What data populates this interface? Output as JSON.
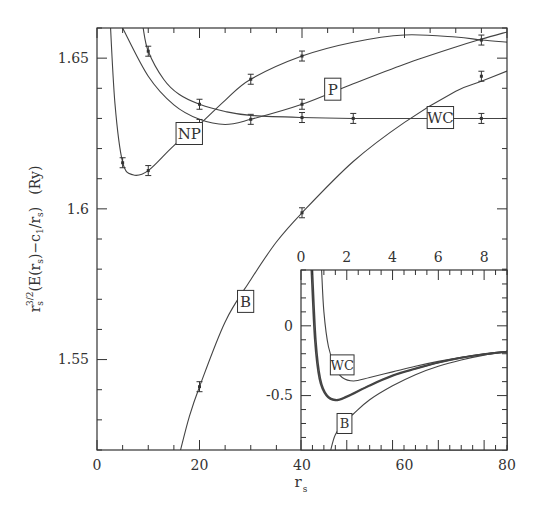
{
  "chart_data": [
    {
      "type": "line",
      "title": "",
      "xlabel": "r_s",
      "ylabel": "r_s^{3/2}(E(r_s) - c_1/r_s)  (Ry)",
      "xlim": [
        0,
        80
      ],
      "ylim": [
        1.52,
        1.66
      ],
      "xticks": [
        0,
        20,
        40,
        60,
        80
      ],
      "yticks": [
        1.55,
        1.6,
        1.65
      ],
      "ytick_labels": [
        "1.55",
        "1.6",
        "1.65"
      ],
      "grid": false,
      "legend": "inline boxed labels",
      "series": [
        {
          "name": "NP",
          "label_pos": [
            18,
            1.625
          ],
          "curve": [
            [
              2.5,
              1.665
            ],
            [
              3.5,
              1.635
            ],
            [
              5,
              1.6155
            ],
            [
              7,
              1.6113
            ],
            [
              10,
              1.6127
            ],
            [
              15,
              1.621
            ],
            [
              20,
              1.628
            ],
            [
              25,
              1.636
            ],
            [
              30,
              1.643
            ],
            [
              40,
              1.6507
            ],
            [
              50,
              1.6553
            ],
            [
              60,
              1.6577
            ],
            [
              70,
              1.657
            ],
            [
              75,
              1.656
            ],
            [
              80,
              1.6553
            ]
          ],
          "points": [
            {
              "x": 5,
              "y": 1.6153
            },
            {
              "x": 10,
              "y": 1.6127
            },
            {
              "x": 30,
              "y": 1.643
            },
            {
              "x": 40,
              "y": 1.6507
            }
          ]
        },
        {
          "name": "P",
          "label_pos": [
            46,
            1.6397
          ],
          "curve": [
            [
              5,
              1.66
            ],
            [
              10,
              1.644
            ],
            [
              15,
              1.6345
            ],
            [
              20,
              1.6297
            ],
            [
              25,
              1.628
            ],
            [
              30,
              1.6297
            ],
            [
              40,
              1.6347
            ],
            [
              50,
              1.6415
            ],
            [
              60,
              1.648
            ],
            [
              70,
              1.6537
            ],
            [
              75,
              1.6563
            ],
            [
              80,
              1.6587
            ]
          ],
          "points": [
            {
              "x": 20,
              "y": 1.628
            },
            {
              "x": 30,
              "y": 1.6297
            },
            {
              "x": 40,
              "y": 1.6347
            },
            {
              "x": 75,
              "y": 1.656
            }
          ]
        },
        {
          "name": "WC",
          "label_pos": [
            67,
            1.6303
          ],
          "curve": [
            [
              9,
              1.66
            ],
            [
              10,
              1.6523
            ],
            [
              13,
              1.643
            ],
            [
              16,
              1.638
            ],
            [
              20,
              1.6347
            ],
            [
              25,
              1.6323
            ],
            [
              30,
              1.631
            ],
            [
              40,
              1.6303
            ],
            [
              50,
              1.63
            ],
            [
              60,
              1.63
            ],
            [
              75,
              1.63
            ],
            [
              80,
              1.63
            ]
          ],
          "points": [
            {
              "x": 10,
              "y": 1.6523
            },
            {
              "x": 20,
              "y": 1.6347
            },
            {
              "x": 40,
              "y": 1.6303
            },
            {
              "x": 50,
              "y": 1.63
            },
            {
              "x": 75,
              "y": 1.63
            }
          ]
        },
        {
          "name": "B",
          "label_pos": [
            29,
            1.5693
          ],
          "curve": [
            [
              16.3,
              1.52
            ],
            [
              18,
              1.531
            ],
            [
              20,
              1.541
            ],
            [
              25,
              1.5625
            ],
            [
              30,
              1.5765
            ],
            [
              35,
              1.589
            ],
            [
              40,
              1.5987
            ],
            [
              50,
              1.6157
            ],
            [
              60,
              1.6287
            ],
            [
              70,
              1.639
            ],
            [
              75,
              1.6423
            ],
            [
              80,
              1.6457
            ]
          ],
          "points": [
            {
              "x": 20,
              "y": 1.541
            },
            {
              "x": 40,
              "y": 1.5987
            },
            {
              "x": 75,
              "y": 1.644
            }
          ]
        }
      ]
    },
    {
      "type": "line",
      "title": "inset",
      "xlabel": "",
      "ylabel": "",
      "xlim": [
        0,
        9
      ],
      "ylim": [
        -0.89,
        0.4
      ],
      "xticks": [
        0,
        2,
        4,
        6,
        8
      ],
      "yticks": [
        0,
        -0.5
      ],
      "ytick_labels": [
        "0",
        "-0.5"
      ],
      "grid": false,
      "series": [
        {
          "name": "NP",
          "label_pos": null,
          "thick": true,
          "curve": [
            [
              0.45,
              0.4
            ],
            [
              0.6,
              -0.1
            ],
            [
              0.8,
              -0.38
            ],
            [
              1.1,
              -0.5
            ],
            [
              1.5,
              -0.535
            ],
            [
              2,
              -0.51
            ],
            [
              3,
              -0.43
            ],
            [
              4,
              -0.36
            ],
            [
              5,
              -0.31
            ],
            [
              6,
              -0.265
            ],
            [
              7,
              -0.23
            ],
            [
              8,
              -0.205
            ],
            [
              9,
              -0.185
            ]
          ]
        },
        {
          "name": "P",
          "label_pos": null,
          "thick": true,
          "curve": [
            [
              0.5,
              0.4
            ],
            [
              0.65,
              -0.1
            ],
            [
              0.85,
              -0.38
            ],
            [
              1.15,
              -0.5
            ],
            [
              1.55,
              -0.53
            ],
            [
              2,
              -0.505
            ],
            [
              3,
              -0.425
            ],
            [
              4,
              -0.355
            ],
            [
              5,
              -0.305
            ],
            [
              6,
              -0.262
            ],
            [
              7,
              -0.228
            ],
            [
              8,
              -0.203
            ],
            [
              9,
              -0.185
            ]
          ]
        },
        {
          "name": "WC",
          "label_pos": [
            1.8,
            -0.28
          ],
          "thick": false,
          "curve": [
            [
              0.9,
              0.4
            ],
            [
              1.0,
              0.1
            ],
            [
              1.2,
              -0.15
            ],
            [
              1.5,
              -0.3
            ],
            [
              1.8,
              -0.37
            ],
            [
              2.3,
              -0.395
            ],
            [
              3,
              -0.37
            ],
            [
              4,
              -0.33
            ],
            [
              5,
              -0.29
            ],
            [
              6,
              -0.255
            ],
            [
              7,
              -0.225
            ],
            [
              8,
              -0.2
            ],
            [
              9,
              -0.183
            ]
          ]
        },
        {
          "name": "B",
          "label_pos": [
            1.9,
            -0.7
          ],
          "thick": false,
          "curve": [
            [
              1.3,
              -0.89
            ],
            [
              1.5,
              -0.78
            ],
            [
              1.9,
              -0.69
            ],
            [
              2.3,
              -0.63
            ],
            [
              3,
              -0.53
            ],
            [
              4,
              -0.43
            ],
            [
              5,
              -0.35
            ],
            [
              6,
              -0.29
            ],
            [
              7,
              -0.245
            ],
            [
              8,
              -0.21
            ],
            [
              9,
              -0.187
            ]
          ]
        }
      ]
    }
  ],
  "axes": {
    "xlabel_main": "r",
    "xlabel_sub": "s",
    "ylabel_parts": [
      "r",
      "s",
      "3/2",
      "(E(r",
      "s",
      ")−c",
      "1",
      "/r",
      "s",
      ")",
      "(Ry)"
    ]
  },
  "labels": {
    "NP": "NP",
    "P": "P",
    "WC": "WC",
    "B": "B"
  }
}
